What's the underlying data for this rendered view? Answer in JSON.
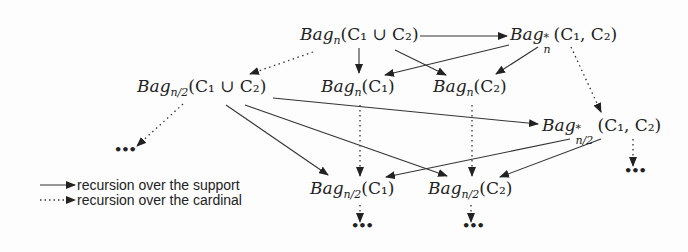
{
  "diagram": {
    "nodes": [
      {
        "id": "bag_n_union",
        "base": "Bag",
        "sub": "n",
        "sup": "",
        "args": "(C₁ ∪ C₂)"
      },
      {
        "id": "bag_star_n",
        "base": "Bag",
        "sub": "n",
        "sup": "*",
        "args": "(C₁, C₂)"
      },
      {
        "id": "bag_n2_union",
        "base": "Bag",
        "sub": "n/2",
        "sup": "",
        "args": "(C₁ ∪ C₂)"
      },
      {
        "id": "bag_n_c1",
        "base": "Bag",
        "sub": "n",
        "sup": "",
        "args": "(C₁)"
      },
      {
        "id": "bag_n_c2",
        "base": "Bag",
        "sub": "n",
        "sup": "",
        "args": "(C₂)"
      },
      {
        "id": "bag_star_n2",
        "base": "Bag",
        "sub": "n/2",
        "sup": "*",
        "args": "(C₁, C₂)"
      },
      {
        "id": "bag_n2_c1",
        "base": "Bag",
        "sub": "n/2",
        "sup": "",
        "args": "(C₁)"
      },
      {
        "id": "bag_n2_c2",
        "base": "Bag",
        "sub": "n/2",
        "sup": "",
        "args": "(C₂)"
      }
    ],
    "ellipsis": "•••",
    "edges": [
      {
        "from": "bag_n_union",
        "to": "bag_star_n",
        "style": "solid"
      },
      {
        "from": "bag_n_union",
        "to": "bag_n_c1",
        "style": "solid"
      },
      {
        "from": "bag_n_union",
        "to": "bag_n_c2",
        "style": "solid"
      },
      {
        "from": "bag_star_n",
        "to": "bag_n_c1",
        "style": "solid"
      },
      {
        "from": "bag_star_n",
        "to": "bag_n_c2",
        "style": "solid"
      },
      {
        "from": "bag_n_union",
        "to": "bag_n2_union",
        "style": "dotted"
      },
      {
        "from": "bag_star_n",
        "to": "bag_star_n2",
        "style": "dotted"
      },
      {
        "from": "bag_n2_union",
        "to": "bag_star_n2",
        "style": "solid"
      },
      {
        "from": "bag_n2_union",
        "to": "bag_n2_c1",
        "style": "solid"
      },
      {
        "from": "bag_n2_union",
        "to": "bag_n2_c2",
        "style": "solid"
      },
      {
        "from": "bag_star_n2",
        "to": "bag_n2_c1",
        "style": "solid"
      },
      {
        "from": "bag_star_n2",
        "to": "bag_n2_c2",
        "style": "solid"
      },
      {
        "from": "bag_n_c1",
        "to": "bag_n2_c1",
        "style": "dotted"
      },
      {
        "from": "bag_n_c2",
        "to": "bag_n2_c2",
        "style": "dotted"
      },
      {
        "from": "bag_n2_union",
        "to": "ellipsis",
        "style": "dotted"
      },
      {
        "from": "bag_star_n2",
        "to": "ellipsis",
        "style": "dotted"
      },
      {
        "from": "bag_n2_c1",
        "to": "ellipsis",
        "style": "dotted"
      },
      {
        "from": "bag_n2_c2",
        "to": "ellipsis",
        "style": "dotted"
      }
    ],
    "legend": {
      "solid_label": "recursion over the support",
      "dotted_label": "recursion over the cardinal"
    },
    "colors": {
      "ink": "#222222",
      "background": "#fdfdfd"
    }
  }
}
